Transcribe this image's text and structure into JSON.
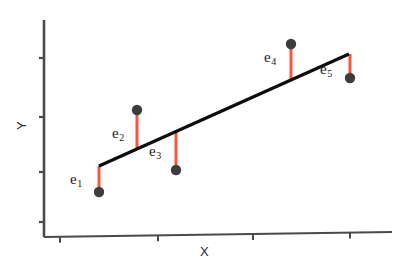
{
  "figure": {
    "name": "least-squares-residuals-diagram",
    "background": "#ffffff"
  },
  "axes": {
    "x_label": "X",
    "y_label": "Y",
    "x_axis": {
      "x1": 44,
      "y1": 237,
      "x2": 392,
      "y2": 232
    },
    "y_axis": {
      "x1": 44,
      "y1": 20,
      "x2": 44,
      "y2": 237
    },
    "axis_color": "#4a4a4a",
    "x_ticks": [
      60,
      158,
      253,
      350
    ],
    "y_ticks": [
      58,
      117,
      172,
      222
    ],
    "tick_length": 6
  },
  "fit_line": {
    "label": "regression-line",
    "color": "#0d0d0d",
    "width": 3.2,
    "x1": 99,
    "y1": 166,
    "x2": 349,
    "y2": 54
  },
  "colors": {
    "residual": "#f4573a",
    "point": "#3d3d3d",
    "line": "#0d0d0d",
    "axis": "#4a4a4a",
    "text": "#1a1a1a"
  },
  "chart_data": {
    "type": "scatter",
    "title": "",
    "xlabel": "X",
    "ylabel": "Y",
    "grid": false,
    "legend": null,
    "series": [
      {
        "name": "observations",
        "points": [
          {
            "label": "e",
            "sub": "1",
            "x": 99,
            "y": 192,
            "fit_y": 166,
            "residual": -26,
            "label_x": 70,
            "label_y": 172
          },
          {
            "label": "e",
            "sub": "2",
            "x": 137,
            "y": 110,
            "fit_y": 149,
            "residual": 39,
            "label_x": 112,
            "label_y": 126
          },
          {
            "label": "e",
            "sub": "3",
            "x": 176,
            "y": 170,
            "fit_y": 131,
            "residual": -39,
            "label_x": 149,
            "label_y": 144
          },
          {
            "label": "e",
            "sub": "4",
            "x": 291,
            "y": 44,
            "fit_y": 80,
            "residual": 36,
            "label_x": 264,
            "label_y": 50
          },
          {
            "label": "e",
            "sub": "5",
            "x": 350,
            "y": 78,
            "fit_y": 54,
            "residual": -24,
            "label_x": 320,
            "label_y": 62
          }
        ]
      }
    ]
  }
}
